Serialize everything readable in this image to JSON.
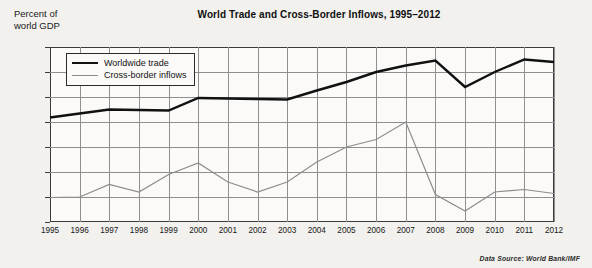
{
  "chart_data": {
    "type": "line",
    "title": "World Trade and Cross-Border Inflows, 1995–2012",
    "ylabel": "Percent of\nworld GDP",
    "xlabel": "",
    "ylim": [
      0,
      35
    ],
    "ytick_values": [
      0,
      5,
      10,
      15,
      20,
      25,
      30,
      35
    ],
    "ytick_labels": [
      "0",
      "5",
      "10",
      "15",
      "20",
      "25",
      "30",
      "35"
    ],
    "grid": true,
    "legend_position": "upper-left-inside",
    "source_note": "Data Source: World Bank/IMF",
    "categories": [
      1995,
      1996,
      1997,
      1998,
      1999,
      2000,
      2001,
      2002,
      2003,
      2004,
      2005,
      2006,
      2007,
      2008,
      2009,
      2010,
      2011,
      2012
    ],
    "xtick_labels": [
      "1995",
      "1996",
      "1997",
      "1998",
      "1999",
      "2000",
      "2001",
      "2002",
      "2003",
      "2004",
      "2005",
      "2006",
      "2007",
      "2008",
      "2009",
      "2010",
      "2011",
      "2012"
    ],
    "series": [
      {
        "name": "Worldwide trade",
        "color": "#111111",
        "width": 2.4,
        "values": [
          20.9,
          21.7,
          22.5,
          22.4,
          22.3,
          24.8,
          24.7,
          24.6,
          24.5,
          26.3,
          28.0,
          30.0,
          31.3,
          32.3,
          27.0,
          30.0,
          32.5,
          32.0
        ]
      },
      {
        "name": "Cross-border inflows",
        "color": "#8c8c8c",
        "width": 1.2,
        "values": [
          4.9,
          5.0,
          7.5,
          6.0,
          9.5,
          11.8,
          8.0,
          6.0,
          8.0,
          12.0,
          15.0,
          16.5,
          20.0,
          5.5,
          2.2,
          6.0,
          6.5,
          5.7
        ]
      }
    ]
  }
}
